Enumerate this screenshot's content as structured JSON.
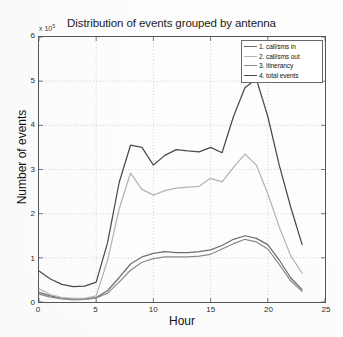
{
  "chart_data": {
    "type": "line",
    "title": "Distribution of events grouped by antenna",
    "xlabel": "Hour",
    "ylabel": "Number of events",
    "y_multiplier_text": "x 10",
    "y_multiplier_exponent": "5",
    "xlim": [
      0,
      25
    ],
    "ylim": [
      0,
      6
    ],
    "grid": true,
    "legend_position": "top-right",
    "xticks": [
      0,
      5,
      10,
      15,
      20,
      25
    ],
    "yticks": [
      0,
      1,
      2,
      3,
      4,
      5,
      6
    ],
    "x": [
      0,
      1,
      2,
      3,
      4,
      5,
      6,
      7,
      8,
      9,
      10,
      11,
      12,
      13,
      14,
      15,
      16,
      17,
      18,
      19,
      20,
      21,
      22,
      23
    ],
    "series": [
      {
        "name": "1. call/sms in",
        "color": "#6e6e72",
        "values": [
          0.22,
          0.14,
          0.09,
          0.07,
          0.07,
          0.1,
          0.26,
          0.55,
          0.86,
          1.02,
          1.1,
          1.14,
          1.12,
          1.12,
          1.14,
          1.18,
          1.28,
          1.42,
          1.5,
          1.44,
          1.3,
          0.95,
          0.55,
          0.28
        ]
      },
      {
        "name": "2. call/sms out",
        "color": "#b4b4b8",
        "values": [
          0.3,
          0.17,
          0.1,
          0.08,
          0.08,
          0.14,
          0.95,
          2.1,
          2.92,
          2.55,
          2.42,
          2.52,
          2.58,
          2.6,
          2.62,
          2.8,
          2.72,
          3.05,
          3.35,
          3.1,
          2.45,
          1.7,
          1.05,
          0.65
        ]
      },
      {
        "name": "3. itinerancy",
        "color": "#8a8a8e",
        "values": [
          0.18,
          0.11,
          0.07,
          0.05,
          0.06,
          0.09,
          0.2,
          0.45,
          0.72,
          0.9,
          0.98,
          1.02,
          1.02,
          1.02,
          1.04,
          1.08,
          1.2,
          1.32,
          1.42,
          1.36,
          1.2,
          0.85,
          0.48,
          0.24
        ]
      },
      {
        "name": "4. total events",
        "color": "#4a4a4e",
        "values": [
          0.7,
          0.52,
          0.4,
          0.35,
          0.36,
          0.45,
          1.35,
          2.7,
          3.55,
          3.5,
          3.1,
          3.32,
          3.45,
          3.42,
          3.4,
          3.5,
          3.38,
          4.2,
          4.85,
          5.05,
          4.2,
          3.1,
          2.15,
          1.3
        ]
      }
    ]
  }
}
